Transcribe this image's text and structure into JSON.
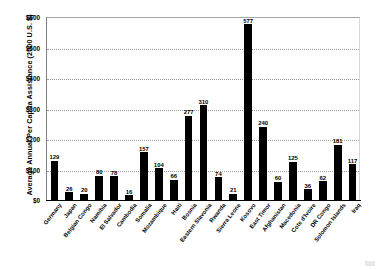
{
  "chart_data": {
    "type": "bar",
    "title": "",
    "xlabel": "",
    "ylabel": "Average Annual Per Capita Assistance (2000 U.S. $)",
    "ylim": [
      0,
      600
    ],
    "ytick_labels": [
      "$600",
      "$500",
      "$400",
      "$300",
      "$200",
      "$100",
      "$0"
    ],
    "ytick_values": [
      600,
      500,
      400,
      300,
      200,
      100,
      0
    ],
    "grid": true,
    "legend": false,
    "bar_color": "#000000",
    "categories": [
      "Germany",
      "Japan",
      "Belgian Congo",
      "Namibia",
      "El Salvador",
      "Cambodia",
      "Somalia",
      "Mozambique",
      "Haiti",
      "Bosnia",
      "Eastern Slavonia",
      "Rwanda",
      "Sierra Leone",
      "Kosovo",
      "East Timor",
      "Afghanistan",
      "Macedonia",
      "Cote d'Ivoire",
      "DR Congo",
      "Solomon Islands",
      "Iraq"
    ],
    "values": [
      129,
      26,
      20,
      80,
      78,
      16,
      157,
      104,
      66,
      277,
      310,
      74,
      21,
      577,
      240,
      60,
      125,
      36,
      62,
      181,
      117
    ],
    "value_labels": [
      "129",
      "26",
      "20",
      "80",
      "78",
      "16",
      "157",
      "104",
      "66",
      "277",
      "310",
      "74",
      "21",
      "577",
      "240",
      "60",
      "125",
      "36",
      "62",
      "181",
      "117"
    ]
  }
}
